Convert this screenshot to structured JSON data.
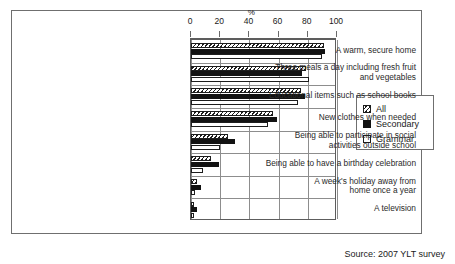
{
  "source_note": "Source: 2007 YLT survey",
  "axis": {
    "unit_label": "%",
    "ticks": [
      0,
      20,
      40,
      60,
      80,
      100
    ]
  },
  "legend": {
    "items": [
      {
        "key": "all",
        "label": "All"
      },
      {
        "key": "secondary",
        "label": "Secondary"
      },
      {
        "key": "grammar",
        "label": "Grammar"
      }
    ]
  },
  "colors": {
    "bar_outline": "#1d1d1d",
    "secondary_fill": "#121212",
    "grammar_fill": "#ffffff",
    "grid": "#8d8d8d",
    "frame": "#6f6f6f"
  },
  "chart_data": {
    "type": "bar",
    "orientation": "horizontal",
    "title": "",
    "xlabel": "%",
    "ylabel": "",
    "xlim": [
      0,
      100
    ],
    "grid": true,
    "legend_position": "right",
    "categories": [
      "A warm, secure home",
      "Three meals a day including fresh fruit\nand vegetables",
      "Educational items such as school books",
      "New clothes when needed",
      "Being able to participate in social\nactivities outside school",
      "Being able to have a birthday celebration",
      "A week's holiday away from\nhome once a year",
      "A television"
    ],
    "series": [
      {
        "name": "All",
        "values": [
          91,
          79,
          75,
          56,
          25,
          14,
          4,
          2
        ]
      },
      {
        "name": "Secondary",
        "values": [
          92,
          76,
          78,
          59,
          30,
          19,
          7,
          4
        ]
      },
      {
        "name": "Grammar",
        "values": [
          90,
          81,
          73,
          53,
          20,
          8,
          3,
          2
        ]
      }
    ]
  }
}
